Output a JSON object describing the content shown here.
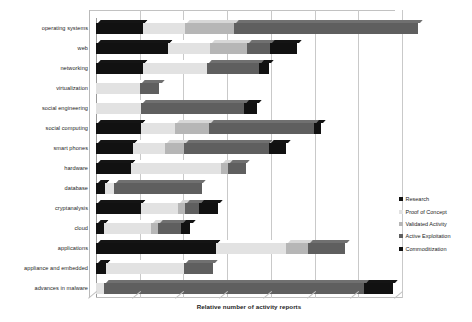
{
  "chart_data": {
    "type": "bar",
    "orientation": "horizontal",
    "stacked": true,
    "title": "",
    "xlabel": "Relative number  of activity reports",
    "ylabel": "",
    "xticklabels": [],
    "grid": true,
    "gridlines_x": [
      0,
      1,
      2,
      3,
      4,
      5,
      6,
      7
    ],
    "xlim": [
      0,
      7
    ],
    "legend_position": "right",
    "categories": [
      "operating systems",
      "web",
      "networking",
      "virtualization",
      "social engineering",
      "social computing",
      "smart phones",
      "hardware",
      "database",
      "cryptanalysis",
      "cloud",
      "applications",
      "appliance and embedded",
      "advances in malware"
    ],
    "series": [
      {
        "name": "Research",
        "color": "#111111",
        "values": [
          1.08,
          1.65,
          1.08,
          0.0,
          0.0,
          1.02,
          0.84,
          0.8,
          0.2,
          1.02,
          0.18,
          2.75,
          0.22,
          0.0
        ]
      },
      {
        "name": "Proof of Concept",
        "color": "#e2e2e2",
        "values": [
          0.95,
          0.95,
          1.45,
          1.0,
          1.02,
          0.78,
          0.74,
          2.05,
          0.22,
          0.85,
          1.08,
          1.6,
          1.8,
          0.18
        ]
      },
      {
        "name": "Validated Activity",
        "color": "#b6b6b6",
        "values": [
          1.12,
          0.85,
          0.0,
          0.0,
          0.0,
          0.78,
          0.44,
          0.18,
          0.0,
          0.16,
          0.16,
          0.5,
          0.0,
          0.0
        ]
      },
      {
        "name": "Active Exploitation",
        "color": "#5f5f5f",
        "values": [
          4.22,
          0.54,
          1.2,
          0.45,
          2.36,
          2.4,
          1.93,
          0.4,
          2.0,
          0.33,
          0.52,
          0.84,
          0.66,
          5.95
        ]
      },
      {
        "name": "Commoditization",
        "color": "#111111",
        "values": [
          0.0,
          0.62,
          0.22,
          0.0,
          0.3,
          0.16,
          0.4,
          0.0,
          0.0,
          0.44,
          0.22,
          0.0,
          0.0,
          0.67
        ]
      }
    ]
  },
  "legend": {
    "items": [
      {
        "label": "Research",
        "color": "#111111"
      },
      {
        "label": "Proof of Concept",
        "color": "#e2e2e2"
      },
      {
        "label": "Validated Activity",
        "color": "#b6b6b6"
      },
      {
        "label": "Active Exploitation",
        "color": "#5f5f5f"
      },
      {
        "label": "Commoditization",
        "color": "#111111"
      }
    ]
  },
  "axis": {
    "x_title": "Relative number  of activity reports"
  }
}
